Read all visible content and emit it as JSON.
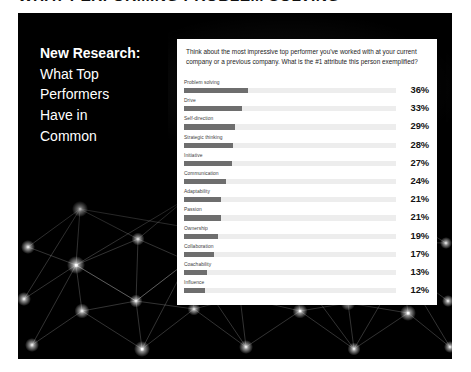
{
  "page": {
    "heading": "WHAT PERFORMING PROBLEM SOLVING"
  },
  "slide": {
    "headline": {
      "lead": "New Research:",
      "lines": [
        "What Top",
        "Performers",
        "Have in",
        "Common"
      ]
    },
    "background": {
      "art_name": "network-constellation-graphic",
      "color": "#000000"
    }
  },
  "panel": {
    "question": "Think about the most impressive top performer you've worked with at your current company or a previous company. What is the #1 attribute this person exemplified?"
  },
  "chart_data": {
    "type": "bar",
    "title": "What Top Performers Have in Common",
    "subtitle": "Think about the most impressive top performer you've worked with at your current company or a previous company. What is the #1 attribute this person exemplified?",
    "orientation": "horizontal",
    "xlabel": "",
    "ylabel": "",
    "xlim": [
      0,
      120
    ],
    "grid": false,
    "legend": false,
    "value_suffix": "%",
    "bar_color": "#6e6e6e",
    "track_color": "#ededed",
    "categories": [
      "Problem solving",
      "Drive",
      "Self-direction",
      "Strategic thinking",
      "Initiative",
      "Communication",
      "Adaptability",
      "Passion",
      "Ownership",
      "Collaboration",
      "Coachability",
      "Influence"
    ],
    "values": [
      36,
      33,
      29,
      28,
      27,
      24,
      21,
      21,
      19,
      17,
      13,
      12
    ],
    "labels": [
      "36%",
      "33%",
      "29%",
      "28%",
      "27%",
      "24%",
      "21%",
      "21%",
      "19%",
      "17%",
      "13%",
      "12%"
    ]
  }
}
